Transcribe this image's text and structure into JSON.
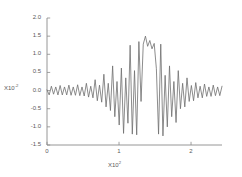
{
  "chart_data": {
    "type": "line",
    "title": "",
    "xlabel": "X10",
    "xlabel_exponent": "2",
    "ylabel": "X10",
    "ylabel_exponent": "-2",
    "xlim": [
      0,
      2.43
    ],
    "ylim": [
      -1.5,
      2.0
    ],
    "grid": false,
    "legend": "none",
    "line_color": "#6e6e6e",
    "axis_color": "#8a8a8a",
    "xticks": [
      0,
      1,
      2
    ],
    "xtick_labels": [
      "0",
      "1",
      "2"
    ],
    "yticks": [
      -1.5,
      -1.0,
      -0.5,
      0.0,
      0.5,
      1.0,
      1.5,
      2.0
    ],
    "ytick_labels": [
      "-1.5",
      "-1.0",
      "-0.5",
      "0.0",
      "0.5",
      "1.0",
      "1.5",
      "2.0"
    ],
    "series": [
      {
        "name": "waveform",
        "x": [
          0.0,
          0.0304,
          0.0608,
          0.0911,
          0.1215,
          0.1519,
          0.1823,
          0.2126,
          0.243,
          0.2734,
          0.3038,
          0.3341,
          0.3645,
          0.3949,
          0.4253,
          0.4556,
          0.486,
          0.5164,
          0.5468,
          0.5771,
          0.6075,
          0.6379,
          0.6683,
          0.6986,
          0.729,
          0.7594,
          0.7898,
          0.8201,
          0.8505,
          0.8809,
          0.9113,
          0.9416,
          0.972,
          1.0024,
          1.0328,
          1.0631,
          1.0935,
          1.1239,
          1.1543,
          1.1846,
          1.215,
          1.2454,
          1.2758,
          1.3061,
          1.3365,
          1.3669,
          1.3973,
          1.4276,
          1.458,
          1.4884,
          1.5188,
          1.5491,
          1.5795,
          1.6099,
          1.6403,
          1.6706,
          1.701,
          1.7314,
          1.7618,
          1.7921,
          1.8225,
          1.8529,
          1.8833,
          1.9136,
          1.944,
          1.9744,
          2.0048,
          2.0351,
          2.0655,
          2.0959,
          2.1263,
          2.1566,
          2.187,
          2.2174,
          2.2478,
          2.2781,
          2.3085,
          2.3389,
          2.3693,
          2.3996,
          2.43
        ],
        "y": [
          0.02,
          -0.12,
          0.12,
          -0.1,
          0.1,
          -0.12,
          0.14,
          -0.12,
          0.1,
          -0.12,
          0.15,
          -0.13,
          0.1,
          -0.13,
          0.16,
          -0.14,
          0.1,
          -0.15,
          0.2,
          -0.18,
          0.12,
          -0.2,
          0.3,
          -0.28,
          0.15,
          -0.32,
          0.45,
          -0.45,
          0.2,
          -0.55,
          0.68,
          -0.72,
          0.25,
          -0.95,
          0.62,
          -1.18,
          0.35,
          -0.9,
          1.25,
          -1.2,
          0.55,
          -1.22,
          1.35,
          -0.3,
          1.28,
          1.5,
          1.22,
          1.38,
          1.15,
          1.3,
          0.6,
          -1.2,
          1.28,
          -1.25,
          0.42,
          -1.0,
          0.68,
          -0.72,
          0.25,
          -0.88,
          0.55,
          -0.5,
          0.2,
          -0.45,
          0.35,
          -0.3,
          0.14,
          -0.28,
          0.22,
          -0.2,
          0.12,
          -0.2,
          0.18,
          -0.16,
          0.1,
          -0.16,
          0.15,
          -0.14,
          0.1,
          -0.14,
          0.12
        ]
      }
    ]
  }
}
